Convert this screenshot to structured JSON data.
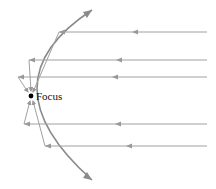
{
  "diagram": {
    "focus_label": "Focus",
    "colors": {
      "curve": "#8a8a8a",
      "ray": "#a0a0a0",
      "focus_dot": "#000000",
      "background": "#ffffff"
    },
    "focus": {
      "x": 31,
      "y": 96
    },
    "incoming_rays_y": [
      32,
      60,
      77,
      124,
      146
    ]
  }
}
